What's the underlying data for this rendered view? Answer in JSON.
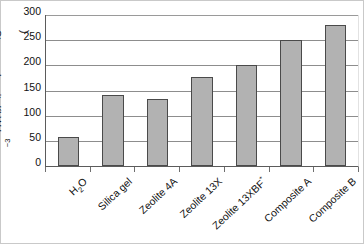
{
  "chart_data": {
    "type": "bar",
    "title": "",
    "xlabel": "",
    "ylabel": "Storage density/(kW h m−3)",
    "ylabel_base": "Storage density/(kW h m",
    "ylabel_exponent": "−3",
    "ylabel_tail": ")",
    "categories": [
      "H2O",
      "Silica gel",
      "Zeolite 4A",
      "Zeolite 13X",
      "Zeolite 13XBF*",
      "Composite A",
      "Composite B"
    ],
    "category_labels": [
      {
        "text": "H",
        "sub": "2",
        "tail": "O",
        "sup": ""
      },
      {
        "text": "Silica gel",
        "sub": "",
        "tail": "",
        "sup": ""
      },
      {
        "text": "Zeolite 4A",
        "sub": "",
        "tail": "",
        "sup": ""
      },
      {
        "text": "Zeolite 13X",
        "sub": "",
        "tail": "",
        "sup": ""
      },
      {
        "text": "Zeolite 13XBF",
        "sub": "",
        "tail": "",
        "sup": "*"
      },
      {
        "text": "Composite A",
        "sub": "",
        "tail": "",
        "sup": ""
      },
      {
        "text": "Composite B",
        "sub": "",
        "tail": "",
        "sup": ""
      }
    ],
    "values": [
      58,
      141,
      133,
      177,
      201,
      250,
      281
    ],
    "ylim": [
      0,
      300
    ],
    "yticks": [
      0,
      50,
      100,
      150,
      200,
      250,
      300
    ],
    "ytick_labels": [
      "0",
      "50",
      "100",
      "150",
      "200",
      "250",
      "300"
    ],
    "grid": true,
    "legend": "none",
    "bar_fill_color": "#b2b2b2",
    "bar_edge_color": "#4a4a4a",
    "gridline_color": "#8d8d8d",
    "axis_color": "#5b5b5b",
    "background_color": "#ffffff"
  }
}
